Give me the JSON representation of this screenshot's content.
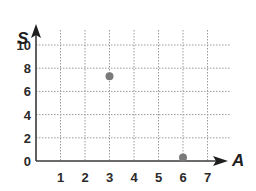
{
  "chart_data": {
    "type": "scatter",
    "title": "",
    "xlabel": "A",
    "ylabel": "S",
    "xlim": [
      0,
      7
    ],
    "ylim": [
      0,
      10
    ],
    "x_ticks": [
      "1",
      "2",
      "3",
      "4",
      "5",
      "6",
      "7"
    ],
    "y_ticks": [
      "0",
      "2",
      "4",
      "6",
      "8",
      "10"
    ],
    "grid": "dotted",
    "series": [
      {
        "name": "points",
        "points": [
          {
            "x": 3,
            "y": 7.3
          },
          {
            "x": 6,
            "y": 0.3
          }
        ]
      }
    ],
    "colors": {
      "point": "#7a7a7a",
      "axis": "#3a3a3a",
      "grid": "#9a9a9a"
    }
  }
}
